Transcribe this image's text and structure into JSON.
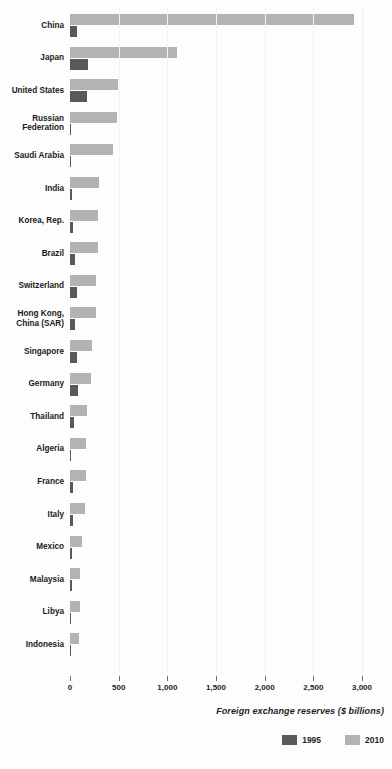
{
  "chart_data": {
    "type": "bar",
    "orientation": "horizontal",
    "title": "",
    "xlabel": "Foreign exchange reserves ($ billions)",
    "ylabel": "",
    "xlim": [
      0,
      3000
    ],
    "xticks": [
      0,
      500,
      1000,
      1500,
      2000,
      2500,
      3000
    ],
    "xtick_labels": [
      "0",
      "500",
      "1,000",
      "1,500",
      "2,000",
      "2,500",
      "3,000"
    ],
    "grid": true,
    "legend_position": "bottom-right",
    "categories": [
      "China",
      "Japan",
      "United States",
      "Russian\nFederation",
      "Saudi Arabia",
      "India",
      "Korea, Rep.",
      "Brazil",
      "Switzerland",
      "Hong Kong,\nChina (SAR)",
      "Singapore",
      "Germany",
      "Thailand",
      "Algeria",
      "France",
      "Italy",
      "Mexico",
      "Malaysia",
      "Libya",
      "Indonesia"
    ],
    "series": [
      {
        "name": "1995",
        "color": "#595959",
        "values": [
          75,
          183,
          176,
          15,
          9,
          18,
          32,
          50,
          68,
          55,
          69,
          85,
          36,
          2,
          30,
          35,
          16,
          24,
          6,
          14
        ]
      },
      {
        "name": "2010",
        "color": "#b3b3b3",
        "values": [
          2914,
          1096,
          489,
          479,
          445,
          297,
          292,
          289,
          270,
          269,
          226,
          217,
          172,
          162,
          166,
          159,
          120,
          107,
          99,
          96
        ]
      }
    ]
  },
  "axis": {
    "title": "Foreign exchange reserves ($ billions)"
  },
  "legend": {
    "items": [
      {
        "label": "1995",
        "color": "#595959"
      },
      {
        "label": "2010",
        "color": "#b3b3b3"
      }
    ]
  },
  "colors": {
    "series_1995": "#595959",
    "series_2010": "#b3b3b3",
    "background": "#fdfdfd",
    "text": "#231f20"
  }
}
